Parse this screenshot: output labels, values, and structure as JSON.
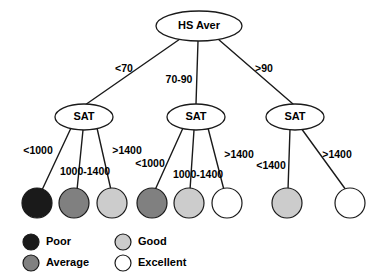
{
  "diagram": {
    "type": "decision-tree",
    "title": "",
    "root": {
      "label": "HS Aver",
      "shape": "ellipse"
    },
    "internal_nodes": [
      {
        "id": "sat-left",
        "label": "SAT"
      },
      {
        "id": "sat-middle",
        "label": "SAT"
      },
      {
        "id": "sat-right",
        "label": "SAT"
      }
    ],
    "level1_edges": [
      {
        "label": "<70",
        "from": "HS Aver",
        "to": "sat-left"
      },
      {
        "label": "70-90",
        "from": "HS Aver",
        "to": "sat-middle"
      },
      {
        "label": ">90",
        "from": "HS Aver",
        "to": "sat-right"
      }
    ],
    "level2_edges": [
      {
        "label": "<1000",
        "from": "sat-left",
        "to": "leaf-1"
      },
      {
        "label": "1000-1400",
        "from": "sat-left",
        "to": "leaf-2"
      },
      {
        "label": ">1400",
        "from": "sat-left",
        "to": "leaf-3"
      },
      {
        "label": "<1000",
        "from": "sat-middle",
        "to": "leaf-4"
      },
      {
        "label": "1000-1400",
        "from": "sat-middle",
        "to": "leaf-5"
      },
      {
        "label": ">1400",
        "from": "sat-middle",
        "to": "leaf-6"
      },
      {
        "label": "<1400",
        "from": "sat-right",
        "to": "leaf-7"
      },
      {
        "label": ">1400",
        "from": "sat-right",
        "to": "leaf-8"
      }
    ],
    "leaves": [
      {
        "id": "leaf-1",
        "outcome": "Poor",
        "color": "#1a1a1a"
      },
      {
        "id": "leaf-2",
        "outcome": "Average",
        "color": "#808080"
      },
      {
        "id": "leaf-3",
        "outcome": "Good",
        "color": "#cccccc"
      },
      {
        "id": "leaf-4",
        "outcome": "Average",
        "color": "#808080"
      },
      {
        "id": "leaf-5",
        "outcome": "Good",
        "color": "#cccccc"
      },
      {
        "id": "leaf-6",
        "outcome": "Excellent",
        "color": "#ffffff"
      },
      {
        "id": "leaf-7",
        "outcome": "Good",
        "color": "#cccccc"
      },
      {
        "id": "leaf-8",
        "outcome": "Excellent",
        "color": "#ffffff"
      }
    ]
  },
  "legend": {
    "items": [
      {
        "label": "Poor",
        "color": "#1a1a1a"
      },
      {
        "label": "Average",
        "color": "#808080"
      },
      {
        "label": "Good",
        "color": "#cccccc"
      },
      {
        "label": "Excellent",
        "color": "#ffffff"
      }
    ]
  }
}
